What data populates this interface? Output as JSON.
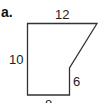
{
  "figure": {
    "part_label": "a.",
    "shape": "pentagon (rectangle with one corner cut diagonally)",
    "dimensions": {
      "top": "12",
      "left": "10",
      "right": "6",
      "bottom": "8"
    },
    "colors": {
      "stroke": "#333333",
      "text": "#222222",
      "background": "#ffffff"
    }
  }
}
